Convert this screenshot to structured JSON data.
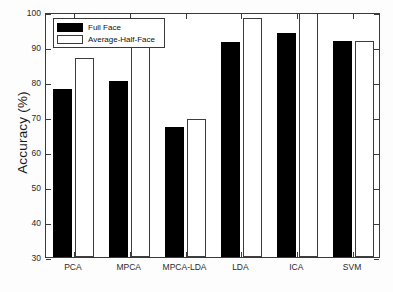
{
  "chart_data": {
    "type": "bar",
    "title": "",
    "xlabel": "",
    "ylabel": "Accuracy (%)",
    "ylim": [
      30,
      100
    ],
    "yticks": [
      30,
      40,
      50,
      60,
      70,
      80,
      90,
      100
    ],
    "ytick_labels": [
      "30",
      "40",
      "50",
      "60",
      "70",
      "80",
      "90",
      "100"
    ],
    "grid": false,
    "legend_position": "upper left",
    "categories": [
      "PCA",
      "MPCA",
      "MPCA-LDA",
      "LDA",
      "ICA",
      "SVM"
    ],
    "series": [
      {
        "name": "Full Face",
        "color": "#000000",
        "style": "filled-black",
        "values": [
          78.0,
          80.2,
          67.1,
          91.5,
          94.1,
          91.8
        ]
      },
      {
        "name": "Average-Half-Face",
        "color": "#ffffff",
        "style": "white-outlined",
        "values": [
          86.8,
          94.0,
          69.3,
          98.3,
          100.5,
          91.8
        ]
      }
    ]
  },
  "legend": {
    "items": [
      {
        "label": "Full Face",
        "swatch": "black-filled-square"
      },
      {
        "label": "Average-Half-Face",
        "swatch": "white-outlined-square"
      }
    ]
  },
  "axes": {
    "y_axis_label": "Accuracy (%)",
    "y_min": "30",
    "y_max": "100"
  }
}
